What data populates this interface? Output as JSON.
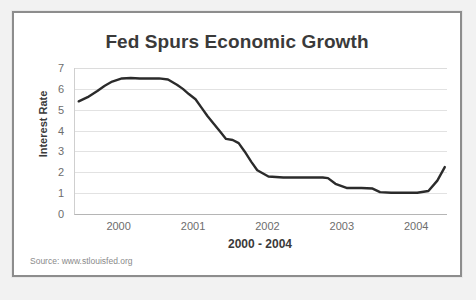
{
  "figure": {
    "source_note": "Source: www.stlouisfed.org",
    "line_color": "#2b2b2b",
    "grid_color": "#e2e2e2",
    "frame_color": "#8d8d8d",
    "text_color": "#3a3a3a",
    "tick_color": "#6d6d6d"
  },
  "chart_data": {
    "type": "line",
    "title": "Fed Spurs Economic Growth",
    "xlabel": "2000 - 2004",
    "ylabel": "Interest Rate",
    "xlim": [
      1999.55,
      2004.55
    ],
    "ylim": [
      0,
      7
    ],
    "grid": true,
    "legend": "none",
    "xticks": [
      2000,
      2001,
      2002,
      2003,
      2004
    ],
    "xtick_labels": [
      "2000",
      "2001",
      "2002",
      "2003",
      "2004"
    ],
    "yticks": [
      0,
      1,
      2,
      3,
      4,
      5,
      6,
      7
    ],
    "ytick_labels": [
      "0",
      "1",
      "2",
      "3",
      "4",
      "5",
      "6",
      "7"
    ],
    "series": [
      {
        "name": "Interest Rate",
        "x": [
          1999.6,
          1999.72,
          1999.85,
          1999.95,
          2000.05,
          2000.18,
          2000.3,
          2000.42,
          2000.55,
          2000.68,
          2000.8,
          2000.92,
          2001.0,
          2001.08,
          2001.17,
          2001.25,
          2001.33,
          2001.42,
          2001.5,
          2001.58,
          2001.67,
          2001.75,
          2001.83,
          2001.92,
          2002.0,
          2002.15,
          2002.35,
          2002.55,
          2002.75,
          2002.88,
          2002.95,
          2003.05,
          2003.2,
          2003.4,
          2003.55,
          2003.65,
          2003.8,
          2004.0,
          2004.15,
          2004.3,
          2004.42,
          2004.52
        ],
        "y": [
          5.4,
          5.6,
          5.9,
          6.15,
          6.35,
          6.5,
          6.52,
          6.5,
          6.5,
          6.5,
          6.45,
          6.2,
          6.0,
          5.75,
          5.5,
          5.1,
          4.7,
          4.3,
          3.95,
          3.6,
          3.55,
          3.4,
          3.0,
          2.5,
          2.1,
          1.8,
          1.75,
          1.75,
          1.75,
          1.75,
          1.72,
          1.45,
          1.25,
          1.25,
          1.22,
          1.05,
          1.02,
          1.02,
          1.02,
          1.1,
          1.6,
          2.25
        ]
      }
    ]
  }
}
